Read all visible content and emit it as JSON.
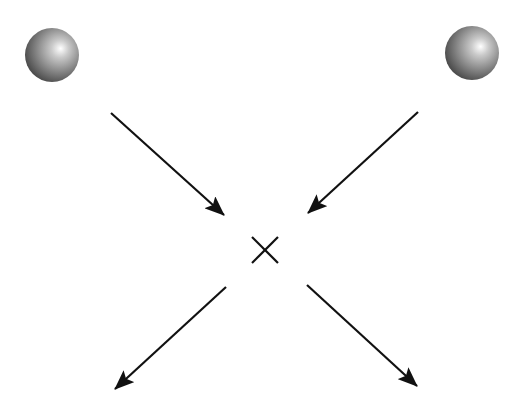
{
  "diagram": {
    "type": "particle-collision",
    "particles": [
      {
        "id": "sphere-left",
        "cx": 52,
        "cy": 55,
        "r": 27
      },
      {
        "id": "sphere-right",
        "cx": 472,
        "cy": 53,
        "r": 27
      }
    ],
    "arrows": [
      {
        "id": "incoming-left",
        "x1": 111,
        "y1": 113,
        "x2": 224,
        "y2": 215
      },
      {
        "id": "incoming-right",
        "x1": 418,
        "y1": 112,
        "x2": 308,
        "y2": 213
      },
      {
        "id": "outgoing-left",
        "x1": 226,
        "y1": 287,
        "x2": 115,
        "y2": 389
      },
      {
        "id": "outgoing-right",
        "x1": 307,
        "y1": 285,
        "x2": 417,
        "y2": 386
      }
    ],
    "collision_point": {
      "cx": 265,
      "cy": 250,
      "half": 13
    },
    "colors": {
      "line": "#111111",
      "sphere_dark": "#4a4a4a",
      "sphere_mid": "#8c8c8c",
      "sphere_highlight": "#ffffff"
    }
  }
}
